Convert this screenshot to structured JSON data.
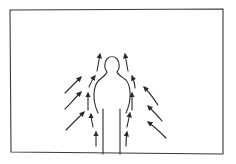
{
  "diagram": {
    "title": "",
    "colors": {
      "line": "#2a2a2a",
      "background": "#ffffff"
    },
    "frame": {
      "x": 10,
      "y": 9,
      "width": 213,
      "height": 145
    },
    "figure": {
      "label": ""
    },
    "arrows": {
      "outer_left_count": 3,
      "inner_left_count": 4,
      "inner_right_count": 4,
      "outer_right_count": 3,
      "direction": "up"
    }
  }
}
